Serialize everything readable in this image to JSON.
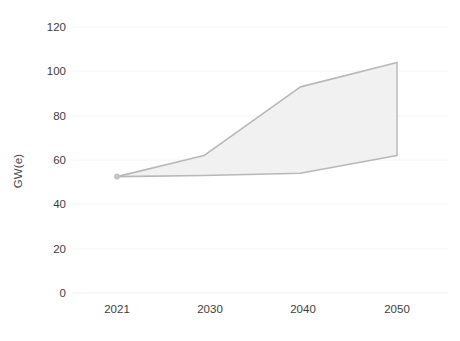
{
  "chart_data": {
    "type": "line",
    "title": "",
    "subtitle": "",
    "xlabel": "",
    "ylabel": "GW(e)",
    "x": [
      2021,
      2030,
      2040,
      2050
    ],
    "categories": [
      "2021",
      "2030",
      "2040",
      "2050"
    ],
    "series": [
      {
        "name": "High case",
        "values": [
          52.5,
          62,
          93,
          104
        ]
      },
      {
        "name": "Low case",
        "values": [
          52.5,
          53,
          54,
          62
        ]
      }
    ],
    "band": {
      "name": "projection-range",
      "upper": [
        52.5,
        62,
        93,
        104
      ],
      "lower": [
        52.5,
        53,
        54,
        62
      ],
      "fill_color": "#f1f1f1"
    },
    "ylim": [
      0,
      120
    ],
    "xlim": [
      2021,
      2050
    ],
    "yticks": [
      0,
      20,
      40,
      60,
      80,
      100,
      120
    ],
    "ytick_labels": [
      "0",
      "20",
      "40",
      "60",
      "80",
      "100",
      "120"
    ],
    "xticks": [
      2021,
      2030,
      2040,
      2050
    ],
    "xtick_labels": [
      "2021",
      "2030",
      "2040",
      "2050"
    ],
    "grid": true,
    "grid_axis": "y",
    "legend": false,
    "legend_position": "none",
    "markers": [
      {
        "x": 2021,
        "y": 52.5,
        "label": "start-point"
      }
    ],
    "colors": {
      "line": "#b8b8b8",
      "fill": "#f1f1f1",
      "grid": "#f4f4f4",
      "axis_text": "#3d3d3d",
      "background": "#ffffff"
    }
  },
  "axis": {
    "y_title": "GW(e)"
  },
  "ylabels": {
    "t0": "0",
    "t20": "20",
    "t40": "40",
    "t60": "60",
    "t80": "80",
    "t100": "100",
    "t120": "120"
  },
  "xlabels": {
    "x2021": "2021",
    "x2030": "2030",
    "x2040": "2040",
    "x2050": "2050"
  },
  "watermark": {
    "line1": "",
    "line2": ""
  }
}
